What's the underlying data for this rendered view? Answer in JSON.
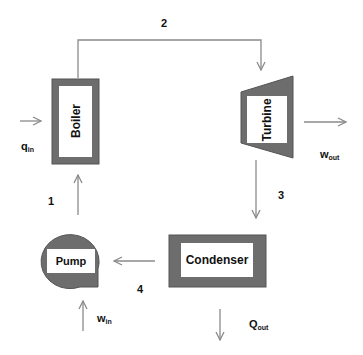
{
  "diagram": {
    "components": {
      "boiler": "Boiler",
      "turbine": "Turbine",
      "condenser": "Condenser",
      "pump": "Pump"
    },
    "states": {
      "s1": "1",
      "s2": "2",
      "s3": "3",
      "s4": "4"
    },
    "energy": {
      "q_in": {
        "main": "q",
        "sub": "in"
      },
      "w_out": {
        "main": "w",
        "sub": "out"
      },
      "q_out": {
        "main": "Q",
        "sub": "out"
      },
      "w_in": {
        "main": "w",
        "sub": "in"
      }
    },
    "colors": {
      "component_fill": "#6d6d6d",
      "component_border": "#555555",
      "inner_fill": "#ffffff",
      "arrow": "#8a8a8a"
    }
  }
}
